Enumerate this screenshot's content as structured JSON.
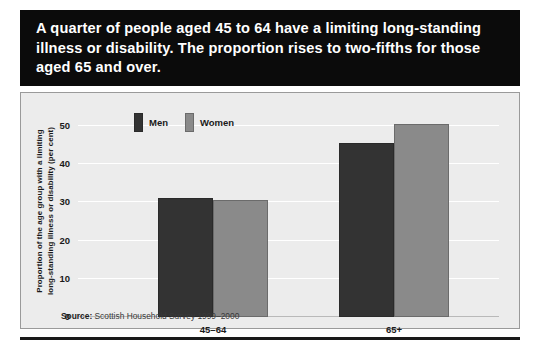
{
  "title": {
    "text": "A quarter of people aged 45 to 64 have a limiting long-standing illness or disability. The proportion rises to two-fifths for those aged 65 and over.",
    "background_color": "#0b0b0b",
    "text_color": "#ffffff"
  },
  "source": {
    "label": "Source:",
    "text": "Scottish Household Survey 1999–2000"
  },
  "legend": {
    "items": [
      {
        "label": "Men",
        "color": "#333333"
      },
      {
        "label": "Women",
        "color": "#8a8a8a"
      }
    ]
  },
  "axis": {
    "y_title": "Proportion of the age group with a limiting\nlong-standing illness or disability (per cent)",
    "y_ticks": [
      "0",
      "10",
      "20",
      "30",
      "40",
      "50"
    ]
  },
  "chart_data": {
    "type": "bar",
    "title": "A quarter of people aged 45 to 64 have a limiting long-standing illness or disability. The proportion rises to two-fifths for those aged 65 and over.",
    "categories": [
      "45–64",
      "65+"
    ],
    "series": [
      {
        "name": "Men",
        "values": [
          28,
          41
        ],
        "color": "#333333"
      },
      {
        "name": "Women",
        "values": [
          27.5,
          45.5
        ],
        "color": "#8a8a8a"
      }
    ],
    "xlabel": "",
    "ylabel": "Proportion of the age group with a limiting long-standing illness or disability (per cent)",
    "ylim": [
      0,
      50
    ],
    "yticks": [
      0,
      10,
      20,
      30,
      40,
      50
    ],
    "grid": true,
    "legend_position": "top-left-inside",
    "source": "Source: Scottish Household Survey 1999–2000"
  }
}
